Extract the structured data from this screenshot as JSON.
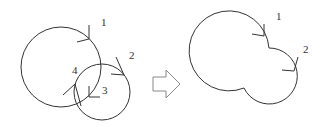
{
  "diagram": {
    "before": {
      "labels": {
        "l1": "1",
        "l2": "2",
        "l3": "3",
        "l4": "4"
      }
    },
    "after": {
      "labels": {
        "l1": "1",
        "l2": "2"
      }
    },
    "transform_arrow": "hollow-right-arrow"
  }
}
